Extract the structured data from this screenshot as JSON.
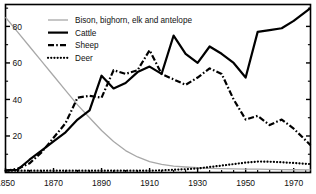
{
  "chart_data": {
    "type": "line",
    "title": "",
    "subtitle": "",
    "xlabel": "",
    "ylabel": "",
    "xlim": [
      1850,
      1977
    ],
    "ylim": [
      0,
      92
    ],
    "grid": false,
    "legend_position": "top-left",
    "xticks": [
      1850,
      1870,
      1890,
      1910,
      1930,
      1950,
      1970
    ],
    "xtick_labels": [
      "1850",
      "1870",
      "1890",
      "1910",
      "1930",
      "1950",
      "1970"
    ],
    "yticks": [
      20,
      40,
      60,
      80
    ],
    "ytick_labels": [
      "20",
      "40",
      "60",
      "80"
    ],
    "series": [
      {
        "name": "Bison, bighorn, elk and antelope",
        "style": "thin-gray",
        "color": "#a8a8a8",
        "x": [
          1850,
          1855,
          1860,
          1865,
          1870,
          1875,
          1880,
          1885,
          1890,
          1895,
          1900,
          1905,
          1910,
          1915,
          1920,
          1925,
          1930,
          1935,
          1940,
          1945,
          1950,
          1955,
          1960,
          1965,
          1970,
          1977
        ],
        "values": [
          85,
          77,
          69,
          61,
          53,
          45,
          37,
          30,
          23,
          17,
          12,
          8.5,
          6,
          4.5,
          3.5,
          3,
          2.6,
          2.3,
          2.1,
          2,
          1.9,
          1.8,
          1.7,
          1.6,
          1.5,
          1.4
        ]
      },
      {
        "name": "Cattle",
        "style": "solid-black",
        "color": "#000000",
        "x": [
          1850,
          1855,
          1860,
          1865,
          1870,
          1875,
          1880,
          1885,
          1890,
          1895,
          1900,
          1905,
          1910,
          1915,
          1920,
          1925,
          1930,
          1935,
          1940,
          1945,
          1950,
          1955,
          1960,
          1965,
          1970,
          1977
        ],
        "values": [
          1,
          1.5,
          7,
          12,
          17,
          22,
          29,
          34,
          53,
          46,
          49,
          55,
          58,
          54,
          75,
          65,
          60,
          69,
          65,
          60,
          52,
          77,
          78,
          79,
          83,
          90
        ]
      },
      {
        "name": "Sheep",
        "style": "dash-dot",
        "color": "#000000",
        "x": [
          1850,
          1855,
          1860,
          1865,
          1870,
          1875,
          1880,
          1885,
          1890,
          1895,
          1900,
          1905,
          1910,
          1915,
          1920,
          1925,
          1930,
          1935,
          1940,
          1945,
          1950,
          1955,
          1960,
          1965,
          1970,
          1977
        ],
        "values": [
          1,
          2,
          5,
          11,
          19,
          27,
          41,
          42,
          41,
          56,
          54,
          56,
          67,
          54,
          51,
          48,
          52,
          57,
          54,
          40,
          29,
          31,
          26,
          29,
          24,
          15
        ]
      },
      {
        "name": "Deer",
        "style": "dotted",
        "color": "#000000",
        "x": [
          1850,
          1855,
          1860,
          1865,
          1870,
          1875,
          1880,
          1885,
          1890,
          1895,
          1900,
          1905,
          1910,
          1915,
          1920,
          1925,
          1930,
          1935,
          1940,
          1945,
          1950,
          1955,
          1960,
          1965,
          1970,
          1977
        ],
        "values": [
          1,
          1,
          1,
          1,
          1,
          1,
          1,
          1,
          1,
          1,
          1,
          1,
          1,
          1.2,
          1.5,
          1.8,
          2.2,
          3,
          3.8,
          4.6,
          5.4,
          6,
          5.9,
          5.6,
          5.2,
          4.6
        ]
      }
    ],
    "legend": [
      {
        "label": "Bison, bighorn, elk and antelope",
        "style": "thin-gray"
      },
      {
        "label": "Cattle",
        "style": "solid-black"
      },
      {
        "label": "Sheep",
        "style": "dash-dot"
      },
      {
        "label": "Deer",
        "style": "dotted"
      }
    ]
  }
}
